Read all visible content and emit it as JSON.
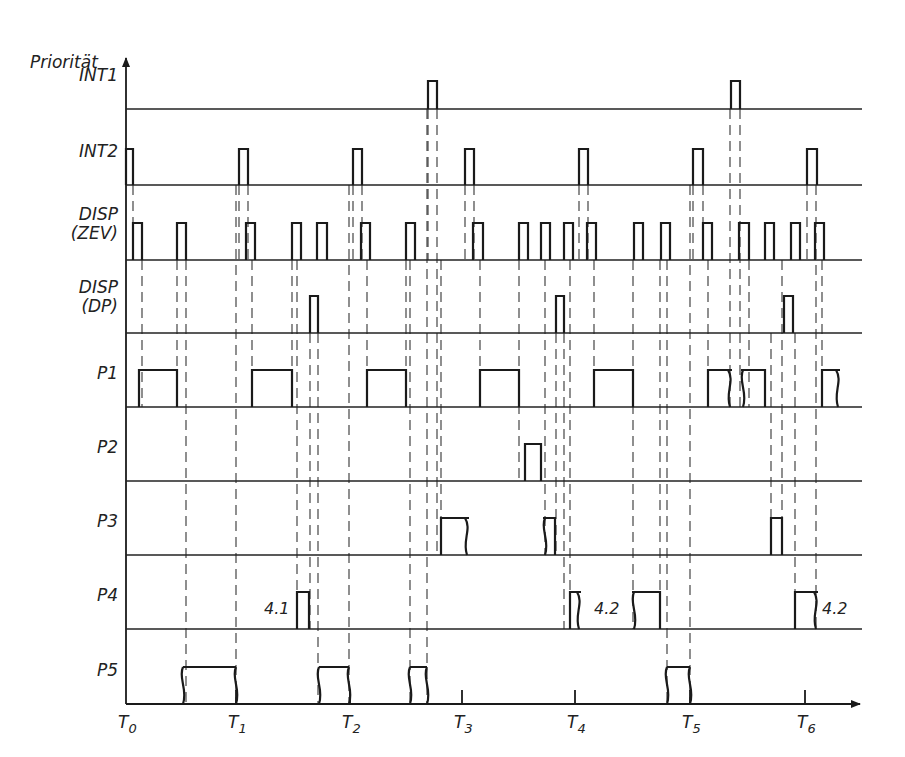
{
  "diagram": {
    "y_axis_label": "Priorität",
    "x_axis": {
      "ticks": [
        {
          "label": "T",
          "sub": "0",
          "x": 126
        },
        {
          "label": "T",
          "sub": "1",
          "x": 236
        },
        {
          "label": "T",
          "sub": "2",
          "x": 350
        },
        {
          "label": "T",
          "sub": "3",
          "x": 462
        },
        {
          "label": "T",
          "sub": "4",
          "x": 575
        },
        {
          "label": "T",
          "sub": "5",
          "x": 690
        },
        {
          "label": "T",
          "sub": "6",
          "x": 805
        }
      ]
    },
    "rows": [
      {
        "id": "int1",
        "label": [
          "INT1"
        ],
        "baseline": 109,
        "pulses": [
          [
            428,
            437,
            "r"
          ],
          [
            731,
            740,
            "r"
          ]
        ]
      },
      {
        "id": "int2",
        "label": [
          "INT2"
        ],
        "baseline": 185,
        "pulses": [
          [
            126,
            133,
            "r"
          ],
          [
            239,
            248,
            "r"
          ],
          [
            353,
            362,
            "r"
          ],
          [
            465,
            474,
            "r"
          ],
          [
            579,
            588,
            "r"
          ],
          [
            693,
            703,
            "r"
          ],
          [
            807,
            817,
            "r"
          ]
        ]
      },
      {
        "id": "disp-zev",
        "label": [
          "DISP",
          "(ZEV)"
        ],
        "baseline": 260,
        "pulses": [
          [
            133,
            142,
            "r"
          ],
          [
            177,
            186,
            "r"
          ],
          [
            246,
            255,
            "r"
          ],
          [
            292,
            301,
            "r"
          ],
          [
            317,
            327,
            "r"
          ],
          [
            361,
            370,
            "r"
          ],
          [
            406,
            415,
            "r"
          ],
          [
            473,
            483,
            "r"
          ],
          [
            519,
            528,
            "r"
          ],
          [
            541,
            550,
            "r"
          ],
          [
            564,
            573,
            "r"
          ],
          [
            587,
            596,
            "r"
          ],
          [
            634,
            643,
            "r"
          ],
          [
            661,
            670,
            "r"
          ],
          [
            703,
            712,
            "r"
          ],
          [
            739,
            749,
            "r"
          ],
          [
            765,
            774,
            "r"
          ],
          [
            791,
            800,
            "r"
          ],
          [
            815,
            824,
            "r"
          ]
        ]
      },
      {
        "id": "disp-dp",
        "label": [
          "DISP",
          "(DP)"
        ],
        "baseline": 333,
        "pulses": [
          [
            310,
            318,
            "r"
          ],
          [
            556,
            564,
            "r"
          ],
          [
            784,
            793,
            "r"
          ]
        ]
      },
      {
        "id": "p1",
        "label": [
          "P1"
        ],
        "baseline": 407,
        "pulses": [
          [
            139,
            177,
            "r"
          ],
          [
            252,
            292,
            "r"
          ],
          [
            367,
            406,
            "r"
          ],
          [
            480,
            519,
            "r"
          ],
          [
            594,
            633,
            "r"
          ],
          [
            708,
            730,
            "wr"
          ],
          [
            743,
            765,
            "wl"
          ],
          [
            822,
            838,
            "wr"
          ]
        ]
      },
      {
        "id": "p2",
        "label": [
          "P2"
        ],
        "baseline": 481,
        "pulses": [
          [
            525,
            541,
            "r"
          ]
        ]
      },
      {
        "id": "p3",
        "label": [
          "P3"
        ],
        "baseline": 555,
        "pulses": [
          [
            441,
            467,
            "wr"
          ],
          [
            545,
            555,
            "wl"
          ],
          [
            771,
            782,
            "r"
          ]
        ]
      },
      {
        "id": "p4",
        "label": [
          "P4"
        ],
        "baseline": 629,
        "pulses": [
          [
            297,
            309,
            "r"
          ],
          [
            570,
            579,
            "wr"
          ],
          [
            634,
            660,
            "wl"
          ],
          [
            795,
            816,
            "wr"
          ]
        ],
        "notes": [
          {
            "text": "4.1",
            "x": 264,
            "y": 614
          },
          {
            "text": "4.2",
            "x": 594,
            "y": 614
          },
          {
            "text": "4.2",
            "x": 822,
            "y": 614
          }
        ]
      },
      {
        "id": "p5",
        "label": [
          "P5"
        ],
        "baseline": 704,
        "pulses": [
          [
            183,
            236,
            "wb"
          ],
          [
            319,
            349,
            "wb"
          ],
          [
            410,
            427,
            "wb"
          ],
          [
            667,
            690,
            "wb"
          ]
        ]
      }
    ]
  }
}
